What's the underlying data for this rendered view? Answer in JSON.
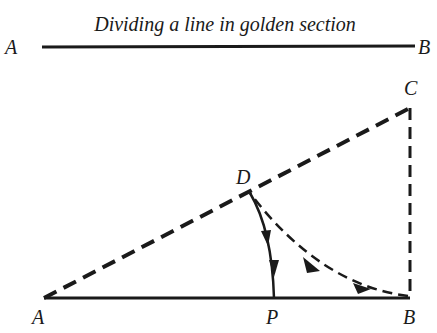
{
  "title": "Dividing a line in golden section",
  "top_line": {
    "left_label": "A",
    "right_label": "B"
  },
  "construction": {
    "points": {
      "A": {
        "label": "A",
        "x": 44,
        "y": 298
      },
      "B": {
        "label": "B",
        "x": 410,
        "y": 298
      },
      "C": {
        "label": "C",
        "x": 410,
        "y": 108
      },
      "D": {
        "label": "D",
        "x": 250,
        "y": 193
      },
      "P": {
        "label": "P",
        "x": 274,
        "y": 298
      }
    },
    "segments": [
      {
        "from": "A",
        "to": "B",
        "style": "solid"
      },
      {
        "from": "A",
        "to": "C",
        "style": "dashed"
      },
      {
        "from": "B",
        "to": "C",
        "style": "dashed"
      },
      {
        "from": "D",
        "to": "P",
        "style": "arc-solid",
        "arrows": 2
      },
      {
        "from": "B",
        "to": "D",
        "style": "arc-dashed",
        "arrows": 2
      }
    ]
  },
  "colors": {
    "ink": "#1a1a1a",
    "background": "#ffffff"
  }
}
